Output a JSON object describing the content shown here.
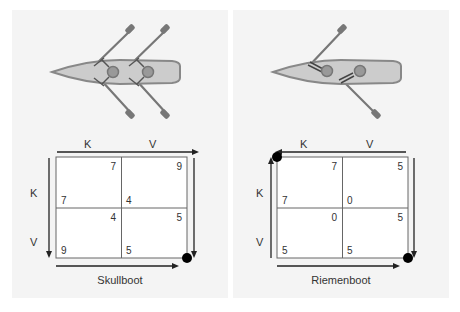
{
  "colors": {
    "background": "#ffffff",
    "panel": "#f4f4f4",
    "hull_fill": "#cccccc",
    "hull_stroke": "#888888",
    "oar": "#777777",
    "seat": "#999999",
    "grid_line": "#555555",
    "arrow": "#222222",
    "dot": "#000000",
    "text": "#333333"
  },
  "panels": [
    {
      "id": "skullboot",
      "caption": "Skullboot",
      "top_labels": [
        "K",
        "V"
      ],
      "side_labels": [
        "K",
        "V"
      ],
      "top_arrow_direction": "right",
      "side_arrow_direction": "down",
      "dot_positions": [
        "bottom-right"
      ],
      "cells": [
        {
          "row": "K",
          "col": "K",
          "top_right": "7",
          "bottom_left": "7"
        },
        {
          "row": "K",
          "col": "V",
          "top_right": "9",
          "bottom_left": "4"
        },
        {
          "row": "V",
          "col": "K",
          "top_right": "4",
          "bottom_left": "9"
        },
        {
          "row": "V",
          "col": "V",
          "top_right": "5",
          "bottom_left": "5"
        }
      ]
    },
    {
      "id": "riemenboot",
      "caption": "Riemenboot",
      "top_labels": [
        "K",
        "V"
      ],
      "side_labels": [
        "K",
        "V"
      ],
      "top_arrow_direction": "left",
      "side_arrow_direction": "up",
      "dot_positions": [
        "top-left",
        "bottom-right"
      ],
      "cells": [
        {
          "row": "K",
          "col": "K",
          "top_right": "7",
          "bottom_left": "7"
        },
        {
          "row": "K",
          "col": "V",
          "top_right": "5",
          "bottom_left": "0"
        },
        {
          "row": "V",
          "col": "K",
          "top_right": "0",
          "bottom_left": "5"
        },
        {
          "row": "V",
          "col": "V",
          "top_right": "5",
          "bottom_left": "5"
        }
      ]
    }
  ]
}
